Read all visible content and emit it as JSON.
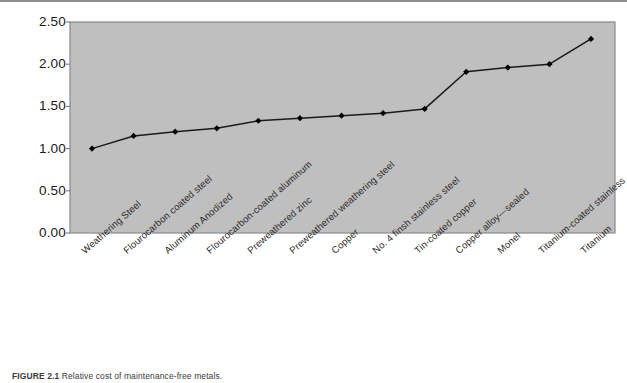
{
  "figure": {
    "caption_label": "FIGURE 2.1",
    "caption_text": "Relative cost of maintenance-free metals."
  },
  "colors": {
    "plot_background": "#bfbfbf",
    "plot_border": "#8a8a8a",
    "line": "#1a1a1a",
    "marker": "#000000",
    "axis_text": "#1a1a1a",
    "top_rule": "#8e8e8e"
  },
  "chart_data": {
    "type": "line",
    "title": "",
    "xlabel": "",
    "ylabel": "",
    "ylim": [
      0.0,
      2.5
    ],
    "ytick_labels": [
      "0.00",
      "0.50",
      "1.00",
      "1.50",
      "2.00",
      "2.50"
    ],
    "ytick_values": [
      0.0,
      0.5,
      1.0,
      1.5,
      2.0,
      2.5
    ],
    "grid": false,
    "legend": "none",
    "markers": "filled-diamond",
    "categories": [
      "Weathering Steel",
      "Flourocarbon coated steel",
      "Aluminum Anodized",
      "Flourocarbon-coated aluminum",
      "Preweathered zinc",
      "Preweathered weathering steel",
      "Copper",
      "No. 4 finsh stainless steel",
      "Tin-coated copper",
      "Copper alloy—sealed",
      "Monel",
      "Titanium-coated stainless",
      "Titanium"
    ],
    "values": [
      1.0,
      1.15,
      1.2,
      1.24,
      1.33,
      1.36,
      1.39,
      1.42,
      1.47,
      1.91,
      1.96,
      2.0,
      2.3
    ]
  }
}
